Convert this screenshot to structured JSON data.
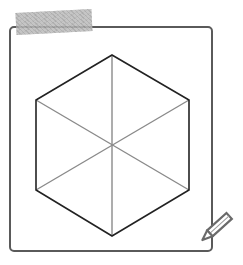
{
  "header": {
    "clipped_text": "‾‾ ‾ ‾ ‾‾ ‾ ‾"
  },
  "figure": {
    "hexagon": {
      "vertices": [
        [
          112,
          55
        ],
        [
          189,
          100
        ],
        [
          189,
          190
        ],
        [
          112,
          236
        ],
        [
          36,
          190
        ],
        [
          36,
          100
        ]
      ],
      "center": [
        112,
        146
      ],
      "stroke": "#222222"
    },
    "diagonals": {
      "stroke": "#8a8a8a",
      "lines": [
        [
          [
            112,
            55
          ],
          [
            112,
            236
          ]
        ],
        [
          [
            36,
            100
          ],
          [
            189,
            190
          ]
        ],
        [
          [
            189,
            100
          ],
          [
            36,
            190
          ]
        ]
      ]
    },
    "frame_color": "#5a5a5a",
    "tape_color": "#b9b9b9",
    "icons": {
      "tape": "tape-strip",
      "pencil": "pencil-icon"
    }
  }
}
